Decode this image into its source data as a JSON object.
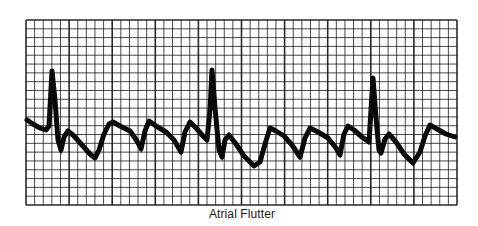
{
  "figure": {
    "caption": "Atrial Flutter",
    "colors": {
      "background": "#ffffff",
      "grid": "#1e1e1e",
      "trace": "#0a0a0a",
      "caption": "#1a1a1a"
    },
    "grid": {
      "x0": 26,
      "y0": 20,
      "x1": 457,
      "y1": 205,
      "columns": 50,
      "rows": 21
    },
    "trace_points": [
      [
        27,
        120
      ],
      [
        33,
        124
      ],
      [
        40,
        128
      ],
      [
        46,
        130
      ],
      [
        49,
        126
      ],
      [
        52,
        71
      ],
      [
        55,
        100
      ],
      [
        58,
        140
      ],
      [
        61,
        150
      ],
      [
        64,
        137
      ],
      [
        68,
        131
      ],
      [
        74,
        136
      ],
      [
        82,
        145
      ],
      [
        90,
        154
      ],
      [
        95,
        158
      ],
      [
        99,
        150
      ],
      [
        104,
        134
      ],
      [
        109,
        124
      ],
      [
        113,
        122
      ],
      [
        120,
        126
      ],
      [
        130,
        131
      ],
      [
        137,
        141
      ],
      [
        141,
        149
      ],
      [
        145,
        131
      ],
      [
        149,
        121
      ],
      [
        156,
        126
      ],
      [
        166,
        132
      ],
      [
        174,
        140
      ],
      [
        181,
        152
      ],
      [
        185,
        132
      ],
      [
        190,
        122
      ],
      [
        196,
        128
      ],
      [
        203,
        136
      ],
      [
        207,
        140
      ],
      [
        210,
        110
      ],
      [
        212,
        70
      ],
      [
        215,
        108
      ],
      [
        219,
        150
      ],
      [
        222,
        157
      ],
      [
        225,
        140
      ],
      [
        229,
        135
      ],
      [
        236,
        144
      ],
      [
        244,
        156
      ],
      [
        254,
        166
      ],
      [
        260,
        162
      ],
      [
        265,
        144
      ],
      [
        270,
        128
      ],
      [
        276,
        131
      ],
      [
        284,
        136
      ],
      [
        292,
        145
      ],
      [
        300,
        157
      ],
      [
        305,
        138
      ],
      [
        310,
        128
      ],
      [
        318,
        132
      ],
      [
        328,
        138
      ],
      [
        336,
        148
      ],
      [
        340,
        155
      ],
      [
        344,
        134
      ],
      [
        348,
        126
      ],
      [
        354,
        130
      ],
      [
        362,
        137
      ],
      [
        369,
        142
      ],
      [
        371,
        110
      ],
      [
        373,
        78
      ],
      [
        376,
        118
      ],
      [
        379,
        150
      ],
      [
        381,
        153
      ],
      [
        385,
        139
      ],
      [
        389,
        134
      ],
      [
        396,
        142
      ],
      [
        404,
        154
      ],
      [
        413,
        163
      ],
      [
        420,
        152
      ],
      [
        425,
        136
      ],
      [
        430,
        125
      ],
      [
        437,
        129
      ],
      [
        446,
        134
      ],
      [
        455,
        137
      ]
    ],
    "r_peaks": [
      {
        "x": 52,
        "y": 71
      },
      {
        "x": 212,
        "y": 70
      },
      {
        "x": 373,
        "y": 78
      }
    ]
  }
}
